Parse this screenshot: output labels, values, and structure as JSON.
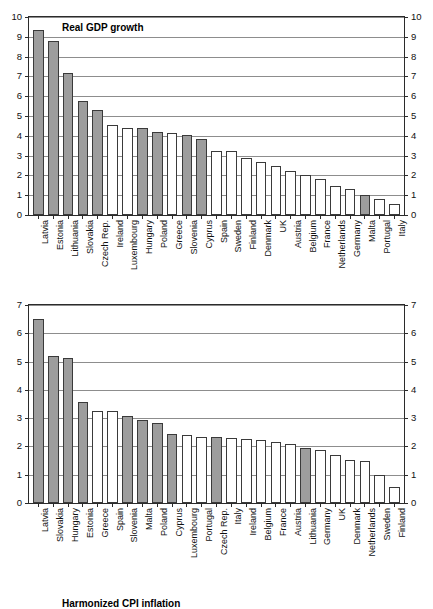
{
  "chart_data": [
    {
      "id": "real-gdp-growth",
      "type": "bar",
      "title": "Real GDP growth",
      "xlabel": "",
      "ylabel": "",
      "ylim": [
        0,
        10
      ],
      "yticks": [
        0,
        1,
        2,
        3,
        4,
        5,
        6,
        7,
        8,
        9,
        10
      ],
      "ytick_labels": [
        "0",
        "1",
        "2",
        "3",
        "4",
        "5",
        "6",
        "7",
        "8",
        "9",
        "10"
      ],
      "grid": true,
      "dual_axis": true,
      "legend": "none",
      "categories": [
        "Latvia",
        "Estonia",
        "Lithuania",
        "Slovakia",
        "Czech Rep.",
        "Ireland",
        "Luxembourg",
        "Hungary",
        "Poland",
        "Greece",
        "Slovenia",
        "Cyprus",
        "Spain",
        "Sweden",
        "Finland",
        "Denmark",
        "UK",
        "Austria",
        "Belgium",
        "France",
        "Netherlands",
        "Germany",
        "Malta",
        "Portugal",
        "Italy"
      ],
      "values": [
        9.35,
        8.8,
        7.15,
        5.75,
        5.3,
        4.55,
        4.4,
        4.4,
        4.2,
        4.15,
        4.05,
        3.85,
        3.25,
        3.25,
        2.9,
        2.7,
        2.5,
        2.2,
        2.0,
        1.8,
        1.45,
        1.3,
        1.03,
        0.8,
        0.55
      ],
      "fills": [
        "gray",
        "gray",
        "gray",
        "gray",
        "gray",
        "white",
        "white",
        "gray",
        "gray",
        "white",
        "gray",
        "gray",
        "white",
        "white",
        "white",
        "white",
        "white",
        "white",
        "white",
        "white",
        "white",
        "white",
        "gray",
        "white",
        "white"
      ]
    },
    {
      "id": "harmonized-cpi-inflation",
      "type": "bar",
      "title": "Harmonized CPI inflation",
      "xlabel": "",
      "ylabel": "",
      "ylim": [
        0,
        7
      ],
      "yticks": [
        0,
        1,
        2,
        3,
        4,
        5,
        6,
        7
      ],
      "ytick_labels": [
        "0",
        "1",
        "2",
        "3",
        "4",
        "5",
        "6",
        "7"
      ],
      "grid": true,
      "dual_axis": true,
      "legend": "none",
      "categories": [
        "Latvia",
        "Slovakia",
        "Hungary",
        "Estonia",
        "Greece",
        "Spain",
        "Slovenia",
        "Malta",
        "Poland",
        "Cyprus",
        "Luxembourg",
        "Portugal",
        "Czech Rep.",
        "Italy",
        "Ireland",
        "Belgium",
        "France",
        "Austria",
        "Lithuania",
        "Germany",
        "UK",
        "Denmark",
        "Netherlands",
        "Sweden",
        "Finland"
      ],
      "values": [
        6.5,
        5.2,
        5.13,
        3.58,
        3.27,
        3.24,
        3.06,
        2.93,
        2.82,
        2.44,
        2.4,
        2.35,
        2.32,
        2.3,
        2.28,
        2.22,
        2.16,
        2.07,
        1.93,
        1.88,
        1.71,
        1.52,
        1.48,
        0.98,
        0.55
      ],
      "fills": [
        "gray",
        "gray",
        "gray",
        "gray",
        "white",
        "white",
        "gray",
        "gray",
        "gray",
        "gray",
        "white",
        "white",
        "gray",
        "white",
        "white",
        "white",
        "white",
        "white",
        "gray",
        "white",
        "white",
        "white",
        "white",
        "white",
        "white"
      ]
    }
  ],
  "colors": {
    "bar_gray": "#9d9d9d",
    "bar_white": "#ffffff",
    "bar_edge": "#3a3a3a",
    "gridline": "#8d8d8d",
    "axis": "#2b2b2b"
  }
}
